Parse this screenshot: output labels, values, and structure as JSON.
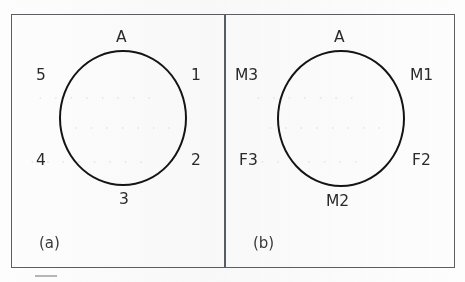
{
  "figure": {
    "background_color": "#fdfdfd",
    "frame_color": "#5a5f66",
    "ink_color": "#141414",
    "text_color": "#2a2a2c",
    "panels": [
      {
        "id": "a",
        "caption": "(a)",
        "center_label": "A",
        "shape": "circle",
        "labels": {
          "top": "A",
          "upper_right": "1",
          "lower_right": "2",
          "bottom": "3",
          "lower_left": "4",
          "upper_left": "5"
        }
      },
      {
        "id": "b",
        "caption": "(b)",
        "center_label": "A",
        "shape": "circle",
        "labels": {
          "top": "A",
          "upper_right": "M1",
          "lower_right": "F2",
          "bottom": "M2",
          "lower_left": "F3",
          "upper_left": "M3"
        }
      }
    ]
  },
  "artifacts": {
    "ghost_rows": [
      {
        "text": "· · · · · · · ·",
        "left": 38,
        "top": 96
      },
      {
        "text": "· · · · · · · · ·",
        "left": 58,
        "top": 124
      },
      {
        "text": "· · · · · · · ·",
        "left": 30,
        "top": 158
      },
      {
        "text": "· · · · · · ·",
        "left": 256,
        "top": 96
      },
      {
        "text": "· · · · · · · ·",
        "left": 268,
        "top": 124
      },
      {
        "text": "· · · · · · ·",
        "left": 260,
        "top": 158
      }
    ],
    "stray_mark": "short-gray-dash"
  }
}
